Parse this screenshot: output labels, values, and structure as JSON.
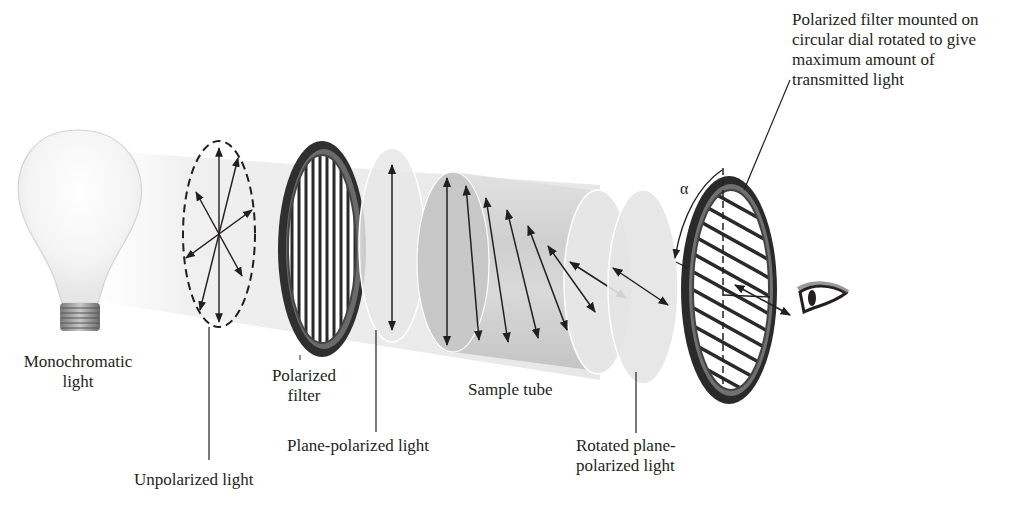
{
  "diagram": {
    "labels": {
      "light_source": [
        "Monochromatic",
        "light"
      ],
      "unpolarized": "Unpolarized light",
      "polarizer": [
        "Polarized",
        "filter"
      ],
      "plane_polarized": "Plane-polarized light",
      "sample_tube": "Sample tube",
      "rotated": [
        "Rotated plane-",
        "polarized light"
      ],
      "analyzer": [
        "Polarized filter mounted on",
        "circular dial rotated to give",
        "maximum amount of",
        "transmitted light"
      ],
      "angle_symbol": "α"
    },
    "components": [
      {
        "id": "bulb",
        "name": "Monochromatic light source"
      },
      {
        "id": "unpolarized-wavefront",
        "name": "Unpolarized light",
        "arrow_count": 8
      },
      {
        "id": "polarizer",
        "name": "Polarized filter",
        "grating": "vertical"
      },
      {
        "id": "plane-polarized-disc",
        "name": "Plane-polarized light",
        "arrow_angle_deg": 0
      },
      {
        "id": "sample-tube",
        "name": "Sample tube",
        "arrow_angles_deg": [
          0,
          6,
          14,
          22,
          32,
          44,
          58,
          70
        ]
      },
      {
        "id": "rotated-disc",
        "name": "Rotated plane-polarized light",
        "arrow_angle_deg": 62
      },
      {
        "id": "analyzer",
        "name": "Analyzer dial",
        "grating": "diagonal",
        "rotation_symbol": "α"
      },
      {
        "id": "eye",
        "name": "Observer eye"
      }
    ],
    "colors": {
      "ink": "#231f20",
      "beam": "#ececec",
      "tube": "#cfcfcf",
      "ring": "#3a3a3a",
      "background": "#ffffff"
    }
  }
}
